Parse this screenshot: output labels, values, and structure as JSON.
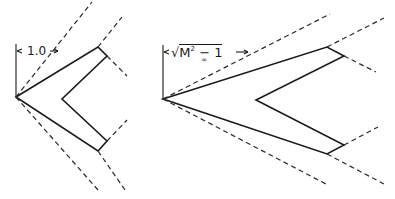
{
  "figures": [
    {
      "id": "left",
      "dimension_label": "1.0",
      "description": "Swept wing with leading edges behind Mach lines (subsonic leading edges)"
    },
    {
      "id": "right",
      "dimension_label": "√M∞² − 1",
      "dimension_parts": {
        "radical": "√",
        "base": "M",
        "superscript": "2",
        "subscript": "∞",
        "minus_one": "− 1"
      },
      "description": "Swept wing with Mach cone relation scaled by sqrt(M∞²−1)"
    }
  ],
  "colors": {
    "ink": "#1a1a1a",
    "background": "#ffffff"
  }
}
